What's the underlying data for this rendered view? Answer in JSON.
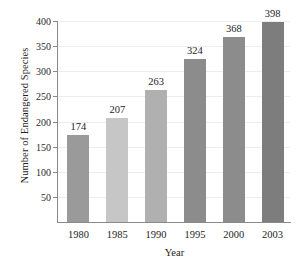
{
  "chart_data": {
    "type": "bar",
    "title": "",
    "xlabel": "Year",
    "ylabel": "Number of Endangered Species",
    "categories": [
      "1980",
      "1985",
      "1990",
      "1995",
      "2000",
      "2003"
    ],
    "values": [
      174,
      207,
      263,
      324,
      368,
      398
    ],
    "bar_colors": [
      "#9a9a9a",
      "#c6c6c6",
      "#b0b0b0",
      "#8c8c8c",
      "#8c8c8c",
      "#7d7d7d"
    ],
    "ylim": [
      0,
      400
    ],
    "yticks": [
      50,
      100,
      150,
      200,
      250,
      300,
      350,
      400
    ],
    "ytick_labels": [
      "50",
      "100",
      "150",
      "200",
      "250",
      "300",
      "350",
      "400"
    ],
    "grid": true,
    "grid_axis": "y",
    "grid_color": "#ededed",
    "axis_color": "#8a8a8a",
    "legend": null,
    "data_labels": [
      "174",
      "207",
      "263",
      "324",
      "368",
      "398"
    ],
    "background_color": "#ffffff",
    "text_color": "#1d1d1d"
  }
}
